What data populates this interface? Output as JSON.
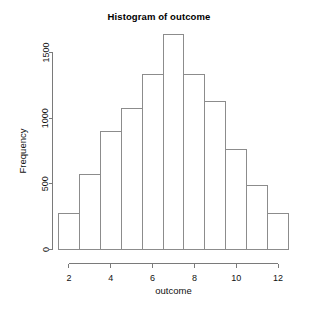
{
  "chart_data": {
    "type": "bar",
    "title": "Histogram of outcome",
    "xlabel": "outcome",
    "ylabel": "Frequency",
    "categories": [
      "2",
      "3",
      "4",
      "5",
      "6",
      "7",
      "8",
      "9",
      "10",
      "11",
      "12"
    ],
    "values": [
      275,
      570,
      900,
      1070,
      1335,
      1640,
      1335,
      1125,
      765,
      490,
      275
    ],
    "bin_edges": [
      1.5,
      2.5,
      3.5,
      4.5,
      5.5,
      6.5,
      7.5,
      8.5,
      9.5,
      10.5,
      11.5,
      12.5
    ],
    "xlim": [
      1.5,
      12.5
    ],
    "ylim": [
      0,
      1700
    ],
    "xticks": [
      "2",
      "4",
      "6",
      "8",
      "10",
      "12"
    ],
    "xtick_values": [
      2,
      4,
      6,
      8,
      10,
      12
    ],
    "yticks": [
      "0",
      "500",
      "1000",
      "1500"
    ],
    "ytick_values": [
      0,
      500,
      1000,
      1500
    ],
    "grid": false,
    "legend": false,
    "bar_fill": "#ffffff",
    "bar_stroke": "#8c8c8c",
    "axis_color": "#7a7a7a",
    "background": "#ffffff"
  }
}
